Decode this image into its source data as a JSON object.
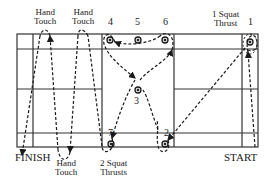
{
  "diagram": {
    "type": "agility-course",
    "labels": {
      "hand_touch_top_1": [
        "Hand",
        "Touch"
      ],
      "hand_touch_top_2": [
        "Hand",
        "Touch"
      ],
      "hand_touch_bottom": [
        "Hand",
        "Touch"
      ],
      "squat_thrust_1": [
        "1 Squat",
        "Thrust"
      ],
      "squat_thrusts_2": [
        "2 Squat",
        "Thrusts"
      ],
      "finish": "FINISH",
      "start": "START"
    },
    "cones": [
      {
        "id": "1",
        "label": "1"
      },
      {
        "id": "2",
        "label": "2"
      },
      {
        "id": "3",
        "label": "3"
      },
      {
        "id": "4",
        "label": "4"
      },
      {
        "id": "5",
        "label": "5"
      },
      {
        "id": "6",
        "label": "6"
      },
      {
        "id": "7",
        "label": "7"
      }
    ],
    "colors": {
      "line": "#1a1a1a",
      "background": "#ffffff"
    }
  }
}
